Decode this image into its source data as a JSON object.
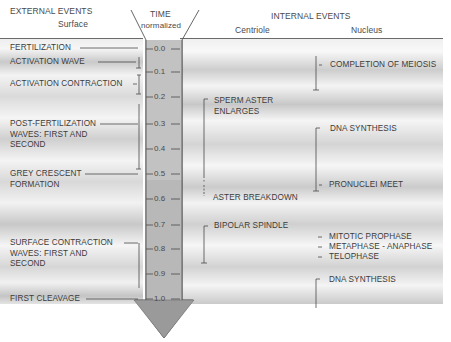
{
  "headers": {
    "external_title": "EXTERNAL EVENTS",
    "external_sub": "Surface",
    "time_title": "TIME",
    "time_sub": "normalized",
    "internal_title": "INTERNAL EVENTS",
    "internal_centriole": "Centriole",
    "internal_nucleus": "Nucleus"
  },
  "time_axis": {
    "ticks": [
      "0.0",
      "0.1",
      "0.2",
      "0.3",
      "0.4",
      "0.5",
      "0.6",
      "0.7",
      "0.8",
      "0.9",
      "1.0"
    ]
  },
  "surface_events": [
    {
      "lines": [
        "FERTILIZATION"
      ],
      "time": "0.0"
    },
    {
      "lines": [
        "ACTIVATION WAVE"
      ],
      "time": "0.03-0.1"
    },
    {
      "lines": [
        "ACTIVATION CONTRACTION"
      ],
      "time": "0.12-0.2"
    },
    {
      "lines": [
        "POST-FERTILIZATION",
        "WAVES: FIRST AND",
        "SECOND"
      ],
      "time": "0.25-0.5"
    },
    {
      "lines": [
        "GREY CRESCENT",
        "FORMATION"
      ],
      "time": "0.5"
    },
    {
      "lines": [
        "SURFACE CONTRACTION",
        "WAVES: FIRST AND",
        "SECOND"
      ],
      "time": "0.8-0.95"
    },
    {
      "lines": [
        "FIRST CLEAVAGE"
      ],
      "time": "1.0"
    }
  ],
  "centriole_events": [
    {
      "lines": [
        "SPERM ASTER",
        "ENLARGES"
      ],
      "time": "0.22-0.57"
    },
    {
      "lines": [
        "ASTER BREAKDOWN"
      ],
      "time": "0.6"
    },
    {
      "lines": [
        "BIPOLAR SPINDLE"
      ],
      "time": "0.72-0.87"
    }
  ],
  "nucleus_events": [
    {
      "lines": [
        "COMPLETION OF MEIOSIS"
      ],
      "time": "0.05-0.2"
    },
    {
      "lines": [
        "DNA SYNTHESIS"
      ],
      "time": "0.35-0.58"
    },
    {
      "lines": [
        "PRONUCLEI MEET"
      ],
      "time": "0.55"
    },
    {
      "lines": [
        "MITOTIC PROPHASE"
      ],
      "time": "0.77"
    },
    {
      "lines": [
        "METAPHASE - ANAPHASE"
      ],
      "time": "0.82"
    },
    {
      "lines": [
        "TELOPHASE"
      ],
      "time": "0.87"
    },
    {
      "lines": [
        "DNA SYNTHESIS"
      ],
      "time": "0.95-1.0"
    }
  ],
  "colors": {
    "axis_fill": "#9a9a9a",
    "axis_column": "#b4b4b4",
    "text": "#3c3c3c"
  }
}
